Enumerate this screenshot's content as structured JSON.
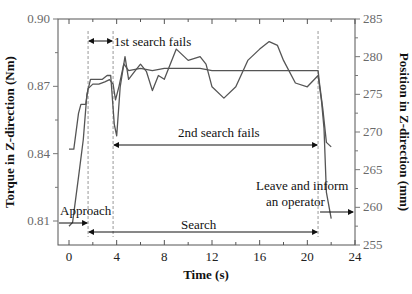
{
  "chart_data": {
    "type": "line",
    "title": "",
    "xlabel": "Time (s)",
    "ylabel": "Torque in Z-direction (Nm)",
    "y2label": "Position in Z-direction (mm)",
    "xlim": [
      -1,
      24
    ],
    "ylim": [
      0.795,
      0.9
    ],
    "y2lim": [
      255,
      285
    ],
    "xticks": [
      "0",
      "4",
      "8",
      "12",
      "16",
      "20",
      "24"
    ],
    "yticks": [
      "0.81",
      "0.84",
      "0.87",
      "0.90"
    ],
    "y2ticks": [
      "255",
      "260",
      "265",
      "270",
      "275",
      "280",
      "285"
    ],
    "grid": false,
    "series": [
      {
        "name": "Torque",
        "axis": "left",
        "x": [
          0,
          0.4,
          0.8,
          1.0,
          1.4,
          1.6,
          2.0,
          2.5,
          3.0,
          3.4,
          3.7,
          3.9,
          4.2,
          4.6,
          5.0,
          6.0,
          7.0,
          8.0,
          9.0,
          10.0,
          11.0,
          12.0,
          13.0,
          14.0,
          15.0,
          16.0,
          17.0,
          18.0,
          19.0,
          20.0,
          20.9,
          21.0,
          21.3,
          21.6,
          22.0
        ],
        "values": [
          0.842,
          0.842,
          0.858,
          0.862,
          0.862,
          0.869,
          0.871,
          0.871,
          0.872,
          0.873,
          0.871,
          0.864,
          0.87,
          0.88,
          0.877,
          0.878,
          0.877,
          0.878,
          0.878,
          0.878,
          0.878,
          0.877,
          0.877,
          0.877,
          0.877,
          0.877,
          0.877,
          0.877,
          0.877,
          0.877,
          0.877,
          0.872,
          0.86,
          0.845,
          0.843
        ]
      },
      {
        "name": "Position",
        "axis": "right",
        "x": [
          0,
          0.3,
          0.8,
          1.2,
          1.5,
          1.8,
          2.2,
          2.8,
          3.2,
          3.5,
          3.8,
          4.0,
          4.3,
          4.7,
          5.0,
          5.5,
          6.0,
          6.5,
          7.0,
          7.5,
          8.0,
          9.0,
          10.0,
          11.0,
          11.5,
          12.0,
          13.0,
          14.0,
          15.0,
          16.0,
          16.8,
          17.5,
          18.0,
          19.0,
          20.0,
          20.9,
          21.2,
          21.4,
          21.6,
          22.0
        ],
        "values": [
          257.5,
          258,
          264,
          269,
          275,
          277,
          277,
          277,
          277.5,
          277.5,
          271,
          269.5,
          276,
          280,
          277,
          278,
          279,
          278,
          275.5,
          277.5,
          277,
          281,
          279.5,
          280,
          279,
          276,
          274.5,
          276,
          279.5,
          281,
          282,
          281.5,
          279.5,
          276.5,
          276,
          277.5,
          274,
          270.5,
          262,
          258.5
        ]
      }
    ],
    "annotations": [
      {
        "text": "1st search fails",
        "x_range": [
          1.6,
          3.7
        ]
      },
      {
        "text": "2nd search fails",
        "x_range": [
          3.7,
          20.9
        ]
      },
      {
        "text": "Approach",
        "x_range": [
          -1,
          1.6
        ]
      },
      {
        "text": "Search",
        "x_range": [
          1.6,
          20.9
        ]
      },
      {
        "text": "Leave and inform an operator",
        "x_range": [
          20.9,
          24
        ]
      }
    ],
    "vlines": [
      1.6,
      3.7,
      20.9
    ]
  },
  "labels": {
    "xlabel": "Time (s)",
    "ylabel": "Torque in Z-direction (Nm)",
    "y2label": "Position in Z-direction (mm)",
    "first_fail": "1st search fails",
    "second_fail": "2nd search fails",
    "approach": "Approach",
    "search": "Search",
    "leave1": "Leave and inform",
    "leave2": "an operator"
  }
}
